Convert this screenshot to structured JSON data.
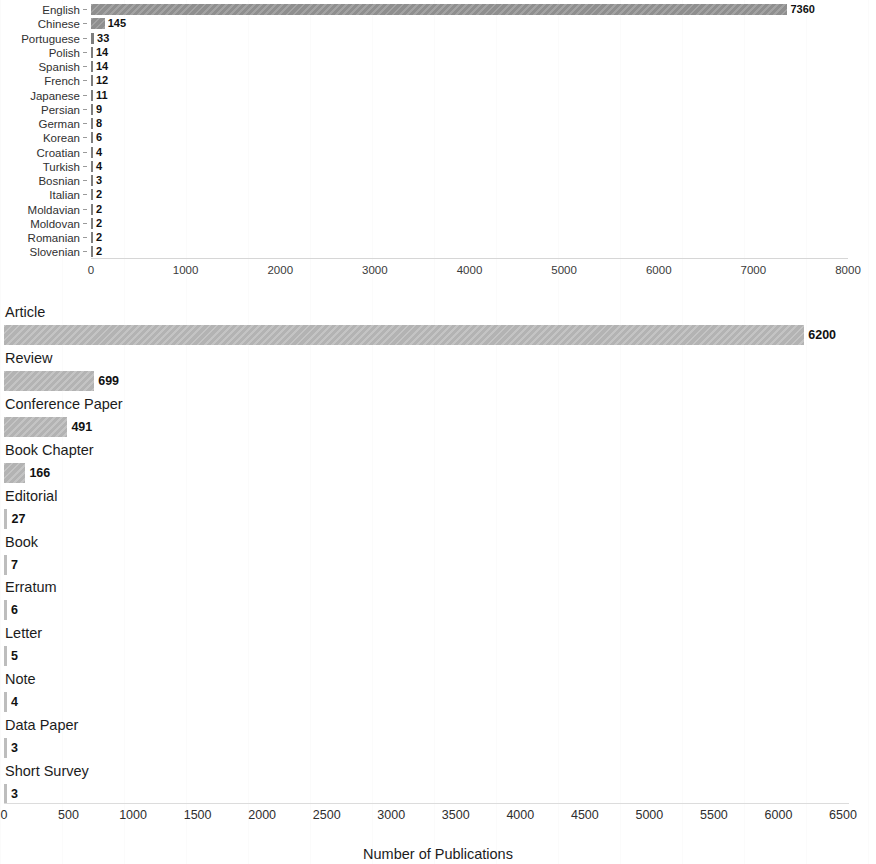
{
  "chart_data": [
    {
      "type": "bar",
      "orientation": "horizontal",
      "panel": "top",
      "title": "",
      "xlabel": "",
      "ylabel": "",
      "xlim": [
        0,
        8000
      ],
      "xticks": [
        0,
        1000,
        2000,
        3000,
        4000,
        5000,
        6000,
        7000,
        8000
      ],
      "xtick_labels": [
        "0",
        "1000",
        "2000",
        "3000",
        "4000",
        "5000",
        "6000",
        "7000",
        "8000"
      ],
      "grid": false,
      "legend": "none",
      "bar_color": "#8f8f8f",
      "categories": [
        "English",
        "Chinese",
        "Portuguese",
        "Polish",
        "Spanish",
        "French",
        "Japanese",
        "Persian",
        "German",
        "Korean",
        "Croatian",
        "Turkish",
        "Bosnian",
        "Italian",
        "Moldavian",
        "Moldovan",
        "Romanian",
        "Slovenian"
      ],
      "values": [
        7360,
        145,
        33,
        14,
        14,
        12,
        11,
        9,
        8,
        6,
        4,
        4,
        3,
        2,
        2,
        2,
        2,
        2
      ],
      "value_labels": [
        "7360",
        "145",
        "33",
        "14",
        "14",
        "12",
        "11",
        "9",
        "8",
        "6",
        "4",
        "4",
        "3",
        "2",
        "2",
        "2",
        "2",
        "2"
      ]
    },
    {
      "type": "bar",
      "orientation": "horizontal",
      "panel": "bottom",
      "title": "",
      "xlabel": "Number of Publications",
      "ylabel": "",
      "xlim": [
        0,
        6500
      ],
      "xticks": [
        0,
        500,
        1000,
        1500,
        2000,
        2500,
        3000,
        3500,
        4000,
        4500,
        5000,
        5500,
        6000,
        6500
      ],
      "xtick_labels": [
        "0",
        "500",
        "1000",
        "1500",
        "2000",
        "2500",
        "3000",
        "3500",
        "4000",
        "4500",
        "5000",
        "5500",
        "6000",
        "6500"
      ],
      "grid": false,
      "legend": "none",
      "bar_color": "#b3b3b3",
      "categories": [
        "Article",
        "Review",
        "Conference Paper",
        "Book Chapter",
        "Editorial",
        "Book",
        "Erratum",
        "Letter",
        "Note",
        "Data Paper",
        "Short Survey"
      ],
      "values": [
        6200,
        699,
        491,
        166,
        27,
        7,
        6,
        5,
        4,
        3,
        3
      ],
      "value_labels": [
        "6200",
        "699",
        "491",
        "166",
        "27",
        "7",
        "6",
        "5",
        "4",
        "3",
        "3"
      ]
    }
  ]
}
